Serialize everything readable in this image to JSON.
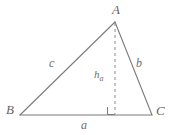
{
  "figure": {
    "type": "geometry-diagram",
    "background_color": "#ffffff",
    "stroke_color": "#777777",
    "label_color": "#6b6b6b"
  },
  "labels": {
    "vertex_a": "A",
    "vertex_b": "B",
    "vertex_c": "C",
    "side_a": "a",
    "side_b": "b",
    "side_c": "c",
    "altitude_base": "h",
    "altitude_subscript": "a"
  },
  "geometry": {
    "vertex_a_point": [
      115,
      22
    ],
    "vertex_b_point": [
      20,
      115
    ],
    "vertex_c_point": [
      152,
      115
    ],
    "altitude_foot_point": [
      115,
      115
    ],
    "right_angle_marker": true,
    "altitude_style": "dashed"
  }
}
